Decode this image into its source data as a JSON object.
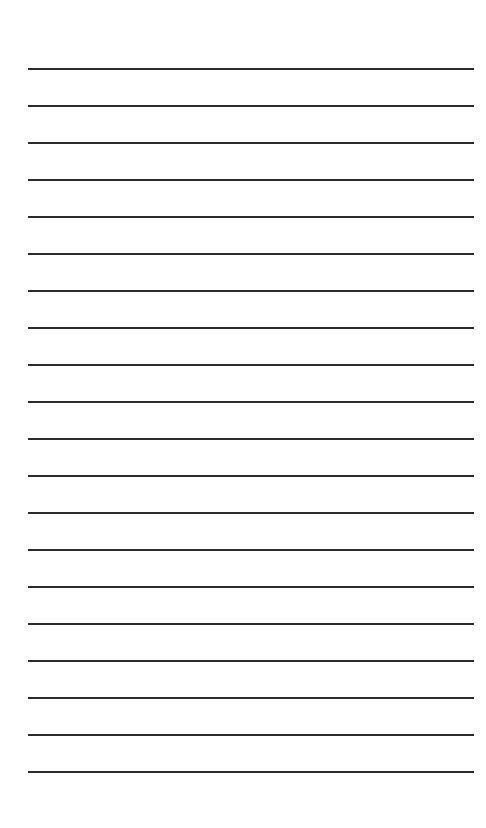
{
  "document": {
    "type": "ruled-paper",
    "title": "",
    "body_text": "",
    "background_color": "#ffffff",
    "page_width": 486,
    "page_height": 828,
    "is_blank": true
  },
  "ruling": {
    "line_color": "#2b2b2b",
    "line_thickness_px": 2,
    "line_count": 20,
    "left_margin_px": 28,
    "right_edge_px": 474,
    "line_length_px": 446,
    "first_line_y_px": 68,
    "line_spacing_px": 37,
    "last_line_y_px": 771,
    "top_margin_px": 68,
    "bottom_margin_px": 55,
    "lines_y": [
      68,
      105,
      142,
      179,
      216,
      253,
      290,
      327,
      364,
      401,
      438,
      475,
      512,
      549,
      586,
      623,
      660,
      697,
      734,
      771
    ]
  }
}
